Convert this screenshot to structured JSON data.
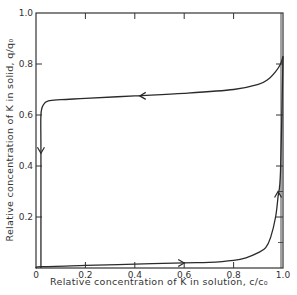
{
  "chart_data": {
    "type": "line",
    "title": "",
    "xlabel": "Relative concentration of K in solution, c/c₀",
    "ylabel": "Relative concentration of K in solid, q/q₀",
    "xlim": [
      0,
      1.0
    ],
    "ylim": [
      0,
      1.0
    ],
    "grid": false,
    "legend": null,
    "x_ticks": [
      "0",
      "0.2",
      "0.4",
      "0.6",
      "0.8",
      "1.0"
    ],
    "y_ticks": [
      "0.2",
      "0.4",
      "0.6",
      "0.8",
      "1.0"
    ],
    "series": [
      {
        "name": "lower-branch",
        "direction": "increasing c/c0 (arrow pointing right, then up)",
        "x": [
          0.0,
          0.02,
          0.2,
          0.4,
          0.6,
          0.7,
          0.8,
          0.85,
          0.9,
          0.93,
          0.95,
          0.97,
          0.98,
          0.99,
          1.0
        ],
        "y": [
          0.0,
          0.005,
          0.01,
          0.015,
          0.02,
          0.022,
          0.03,
          0.04,
          0.06,
          0.08,
          0.12,
          0.2,
          0.28,
          0.38,
          0.83
        ]
      },
      {
        "name": "upper-branch",
        "direction": "decreasing c/c0 (arrow pointing left, then down)",
        "x": [
          1.0,
          0.99,
          0.97,
          0.94,
          0.9,
          0.8,
          0.6,
          0.4,
          0.2,
          0.1,
          0.05,
          0.03,
          0.02,
          0.02,
          0.02
        ],
        "y": [
          0.83,
          0.8,
          0.77,
          0.74,
          0.72,
          0.7,
          0.685,
          0.675,
          0.665,
          0.66,
          0.655,
          0.64,
          0.6,
          0.45,
          0.0
        ]
      }
    ],
    "annotations": [
      {
        "type": "arrow",
        "at": [
          0.6,
          0.02
        ],
        "direction": "right"
      },
      {
        "type": "arrow",
        "at": [
          0.98,
          0.3
        ],
        "direction": "up"
      },
      {
        "type": "arrow",
        "at": [
          0.42,
          0.675
        ],
        "direction": "left"
      },
      {
        "type": "arrow",
        "at": [
          0.02,
          0.45
        ],
        "direction": "down"
      }
    ]
  },
  "labels": {
    "xlabel": "Relative concentration of K in solution, c/c₀",
    "ylabel": "Relative concentration of K in solid, q/q₀",
    "x_ticks": [
      "0",
      "0.2",
      "0.4",
      "0.6",
      "0.8",
      "1.0"
    ],
    "y_ticks": [
      "0.2",
      "0.4",
      "0.6",
      "0.8",
      "1.0"
    ]
  },
  "colors": {
    "line": "#2a2a2a",
    "axis": "#333333",
    "background": "#ffffff"
  }
}
